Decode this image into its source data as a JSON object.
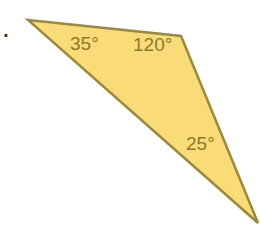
{
  "problem": {
    "number_label": "."
  },
  "triangle": {
    "fill": "#f9dc78",
    "stroke": "#9c8a3c",
    "vertices": [
      [
        28,
        20
      ],
      [
        181,
        36
      ],
      [
        258,
        223
      ]
    ],
    "angles": [
      {
        "vertex": "left",
        "label": "35°",
        "x": 70,
        "y": 50
      },
      {
        "vertex": "top-right",
        "label": "120°",
        "x": 133,
        "y": 51
      },
      {
        "vertex": "bottom",
        "label": "25°",
        "x": 186,
        "y": 150
      }
    ]
  }
}
